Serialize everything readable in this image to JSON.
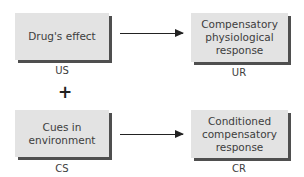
{
  "diagram": {
    "top_row": {
      "stimulus_box": {
        "text": "Drug's effect",
        "label": "US"
      },
      "response_box": {
        "text": "Compensatory\nphysiological\nresponse",
        "label": "UR"
      }
    },
    "connector": {
      "symbol": "+"
    },
    "bottom_row": {
      "stimulus_box": {
        "text": "Cues in\nenvironment",
        "label": "CS"
      },
      "response_box": {
        "text": "Conditioned\ncompensatory\nresponse",
        "label": "CR"
      }
    },
    "arrows": [
      {
        "from": "Drug's effect",
        "to": "Compensatory physiological response",
        "icon": "arrow-right-icon"
      },
      {
        "from": "Cues in environment",
        "to": "Conditioned compensatory response",
        "icon": "arrow-right-icon"
      }
    ],
    "colors": {
      "box_fill": "#e3e3e3",
      "box_shadow": "#4f4f4f",
      "text": "#3d3d3d",
      "arrow": "#222222"
    }
  }
}
